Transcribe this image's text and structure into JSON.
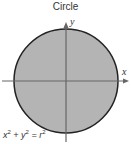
{
  "title": "Circle",
  "axes": {
    "x_label": "x",
    "y_label": "y"
  },
  "equation": {
    "base1": "x",
    "exp1": "2",
    "op1": " + ",
    "base2": "y",
    "exp2": "2",
    "op2": " = ",
    "base3": "r",
    "exp3": "2"
  },
  "colors": {
    "fill": "#b4b4b4",
    "stroke": "#222222",
    "axis": "#666666"
  }
}
